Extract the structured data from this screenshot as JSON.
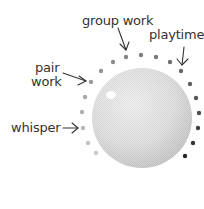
{
  "diagram": {
    "labels": {
      "group_work": "group work",
      "playtime": "playtime",
      "pair_work_line1": "pair",
      "pair_work_line2": "work",
      "whisper": "whisper"
    },
    "dial": {
      "center": [
        142,
        118
      ],
      "radius": 50,
      "colors": {
        "edge": "#cfcfcf",
        "center": "#eeeeee",
        "highlight": "#ffffff"
      }
    },
    "dots": [
      {
        "x": 96,
        "y": 153,
        "color": "#c8c8c8"
      },
      {
        "x": 88,
        "y": 143,
        "color": "#c2c2c2"
      },
      {
        "x": 83,
        "y": 128,
        "color": "#b8b8b8"
      },
      {
        "x": 82,
        "y": 112,
        "color": "#b0b0b0"
      },
      {
        "x": 85,
        "y": 97,
        "color": "#a8a8a8"
      },
      {
        "x": 91,
        "y": 82,
        "color": "#9c9c9c"
      },
      {
        "x": 101,
        "y": 71,
        "color": "#949494"
      },
      {
        "x": 113,
        "y": 62,
        "color": "#8c8c8c"
      },
      {
        "x": 126,
        "y": 57,
        "color": "#858585"
      },
      {
        "x": 141,
        "y": 55,
        "color": "#7e7e7e"
      },
      {
        "x": 156,
        "y": 57,
        "color": "#787878"
      },
      {
        "x": 170,
        "y": 62,
        "color": "#707070"
      },
      {
        "x": 181,
        "y": 71,
        "color": "#686868"
      },
      {
        "x": 190,
        "y": 84,
        "color": "#5e5e5e"
      },
      {
        "x": 196,
        "y": 98,
        "color": "#555555"
      },
      {
        "x": 199,
        "y": 113,
        "color": "#4c4c4c"
      },
      {
        "x": 198,
        "y": 128,
        "color": "#404040"
      },
      {
        "x": 193,
        "y": 143,
        "color": "#333333"
      },
      {
        "x": 185,
        "y": 156,
        "color": "#262626"
      }
    ]
  }
}
